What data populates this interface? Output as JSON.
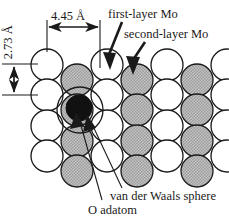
{
  "figure": {
    "type": "surface-structure-diagram"
  },
  "dimensions": {
    "horizontal": {
      "value": "4.45 Å",
      "orientation": "horizontal",
      "from_x": 47,
      "to_x": 100
    },
    "vertical": {
      "value": "2.73 Å",
      "orientation": "vertical",
      "from_y": 65,
      "to_y": 95
    }
  },
  "labels": {
    "first_layer": "first-layer Mo",
    "second_layer": "second-layer Mo",
    "vdw_sphere": "van der Waals sphere",
    "o_adatom": "O adatom"
  },
  "colors": {
    "first_layer_fill": "#ffffff",
    "second_layer_fill": "#b9b9b9",
    "adatom_fill": "#111111",
    "stroke": "#1a1a1a",
    "text": "#1a1a1a",
    "background": "#ffffff"
  },
  "lattice": {
    "radius": 16,
    "column_spacing": 30,
    "row_spacing": 30.5,
    "first_layer_circles": [
      {
        "cx": 47,
        "cy": 65
      },
      {
        "cx": 107,
        "cy": 65
      },
      {
        "cx": 167,
        "cy": 65
      },
      {
        "cx": 227,
        "cy": 65
      },
      {
        "cx": 47,
        "cy": 95
      },
      {
        "cx": 107,
        "cy": 95
      },
      {
        "cx": 167,
        "cy": 95
      },
      {
        "cx": 227,
        "cy": 95
      },
      {
        "cx": 47,
        "cy": 126
      },
      {
        "cx": 107,
        "cy": 126
      },
      {
        "cx": 167,
        "cy": 126
      },
      {
        "cx": 227,
        "cy": 126
      },
      {
        "cx": 47,
        "cy": 156
      },
      {
        "cx": 107,
        "cy": 156
      },
      {
        "cx": 167,
        "cy": 156
      },
      {
        "cx": 227,
        "cy": 156
      }
    ],
    "second_layer_circles": [
      {
        "cx": 77,
        "cy": 80
      },
      {
        "cx": 137,
        "cy": 80
      },
      {
        "cx": 197,
        "cy": 80
      },
      {
        "cx": 77,
        "cy": 110
      },
      {
        "cx": 137,
        "cy": 110
      },
      {
        "cx": 197,
        "cy": 110
      },
      {
        "cx": 77,
        "cy": 141
      },
      {
        "cx": 137,
        "cy": 141
      },
      {
        "cx": 197,
        "cy": 141
      },
      {
        "cx": 77,
        "cy": 171
      },
      {
        "cx": 137,
        "cy": 171
      },
      {
        "cx": 197,
        "cy": 171
      }
    ]
  },
  "adatom": {
    "cx": 79,
    "cy": 108,
    "r": 13
  },
  "vdw_sphere": {
    "cx": 80,
    "cy": 110,
    "r": 23
  }
}
